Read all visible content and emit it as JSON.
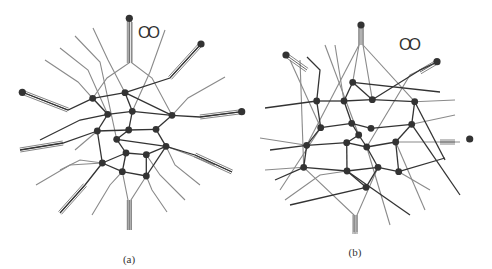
{
  "figure": {
    "panels": [
      {
        "id": "a",
        "caption": "(a)",
        "caption_pos": [
          129,
          253
        ],
        "marker_label": "OO",
        "marker_pos": [
          138,
          24
        ],
        "nodes": [
          [
            92.7,
            98.3
          ],
          [
            125,
            92.7
          ],
          [
            107.7,
            114.3
          ],
          [
            132.3,
            111.3
          ],
          [
            172,
            115.3
          ],
          [
            97.3,
            131
          ],
          [
            128.7,
            130
          ],
          [
            156,
            129.3
          ],
          [
            116.7,
            139.3
          ],
          [
            166,
            146.3
          ],
          [
            126,
            153
          ],
          [
            146.3,
            154.7
          ],
          [
            102.3,
            163
          ],
          [
            122.3,
            171.7
          ],
          [
            146.3,
            176
          ]
        ],
        "terminals": [
          [
            129.3,
            18.3
          ],
          [
            201,
            44
          ],
          [
            22.3,
            92.3
          ],
          [
            241.7,
            111.7
          ]
        ],
        "dark_edges": [
          [
            0,
            1
          ],
          [
            1,
            4
          ],
          [
            2,
            3
          ],
          [
            3,
            4
          ],
          [
            5,
            6
          ],
          [
            6,
            7
          ],
          [
            8,
            9
          ],
          [
            10,
            11
          ],
          [
            11,
            9
          ],
          [
            12,
            13
          ],
          [
            13,
            14
          ],
          [
            0,
            2
          ],
          [
            2,
            5
          ],
          [
            5,
            12
          ],
          [
            1,
            3
          ],
          [
            3,
            6
          ],
          [
            6,
            8
          ],
          [
            8,
            10
          ],
          [
            10,
            13
          ],
          [
            4,
            7
          ],
          [
            7,
            9
          ],
          [
            9,
            14
          ],
          [
            12,
            10
          ],
          [
            14,
            11
          ]
        ],
        "dark_paths": [
          "M22,92 L68,110 L92.7,98.3",
          "M201,44 L170,78 L125,92.7",
          "M241.7,111.7 L200,117 L172,115.3",
          "M20,150 L63,143 L97.3,131",
          "M60,213 L85,185 L102.3,163",
          "M232,172 L195,155 L166,146.3",
          "M40,140 L80,120 L107.7,114.3"
        ],
        "gray_paths": [
          "M129,22 L129,63 L107,78 L92.7,98.3",
          "M132,22 L132,63 L152,78 L172,115.3",
          "M45,60 L78,82 L92.7,98.3",
          "M60,48 L88,70 L107.7,114.3",
          "M75,36 L100,62 L116.7,139.3",
          "M93,28 L108,60 L125,92.7",
          "M165,30 L150,72 L132.3,111.3",
          "M225,77 L188,98 L172,115.3",
          "M36,185 L70,165 L102.3,163",
          "M128,230 L128,200 L122.3,171.7",
          "M131,230 L131,200 L146.3,176",
          "M92,215 L110,185 L122.3,171.7",
          "M167,212 L152,190 L146.3,176",
          "M185,200 L160,175 L146.3,154.7",
          "M200,185 L175,165 L166,146.3",
          "M215,165 L190,155 L166,146.3",
          "M75,150 L97.3,131",
          "M60,170 L80,160 L102.3,163"
        ],
        "triple_leads": [
          {
            "from": [
              129.3,
              18.3
            ],
            "to": [
              129.3,
              63
            ],
            "dir": "v"
          },
          {
            "from": [
              201,
              44
            ],
            "to": [
              170,
              78
            ],
            "dir": "d"
          },
          {
            "from": [
              22.3,
              92.3
            ],
            "to": [
              68,
              110
            ],
            "dir": "d"
          },
          {
            "from": [
              241.7,
              111.7
            ],
            "to": [
              200,
              117
            ],
            "dir": "d"
          },
          {
            "from": [
              20,
              150
            ],
            "to": [
              63,
              143
            ],
            "dir": "d"
          },
          {
            "from": [
              60,
              213
            ],
            "to": [
              85,
              185
            ],
            "dir": "d"
          },
          {
            "from": [
              232,
              172
            ],
            "to": [
              195,
              155
            ],
            "dir": "d"
          },
          {
            "from": [
              129.3,
              230
            ],
            "to": [
              129.3,
              200
            ],
            "dir": "v"
          }
        ]
      },
      {
        "id": "b",
        "caption": "(b)",
        "caption_pos": [
          355,
          246
        ],
        "marker_label": "OO",
        "marker_pos": [
          399,
          36
        ],
        "nodes": [
          [
            352.7,
            82.3
          ],
          [
            316.7,
            101
          ],
          [
            344,
            101
          ],
          [
            372.3,
            99.7
          ],
          [
            414.7,
            101.7
          ],
          [
            320.7,
            127.7
          ],
          [
            351.7,
            123.3
          ],
          [
            371,
            128.3
          ],
          [
            411.7,
            124.3
          ],
          [
            358.7,
            135
          ],
          [
            306.7,
            145.3
          ],
          [
            346.7,
            142.7
          ],
          [
            366.7,
            147
          ],
          [
            395.7,
            142
          ],
          [
            303.7,
            167.3
          ],
          [
            347,
            171
          ],
          [
            378,
            167.3
          ],
          [
            398.7,
            171.7
          ],
          [
            366,
            187.3
          ]
        ],
        "terminals": [
          [
            361,
            25
          ],
          [
            286,
            55
          ],
          [
            437,
            61.7
          ],
          [
            469.7,
            139
          ]
        ],
        "dark_edges": [
          [
            0,
            2
          ],
          [
            1,
            2
          ],
          [
            2,
            3
          ],
          [
            3,
            4
          ],
          [
            1,
            5
          ],
          [
            5,
            6
          ],
          [
            6,
            7
          ],
          [
            7,
            8
          ],
          [
            8,
            4
          ],
          [
            0,
            3
          ],
          [
            2,
            6
          ],
          [
            6,
            9
          ],
          [
            9,
            12
          ],
          [
            5,
            10
          ],
          [
            10,
            14
          ],
          [
            14,
            15
          ],
          [
            15,
            16
          ],
          [
            16,
            17
          ],
          [
            15,
            18
          ],
          [
            11,
            12
          ],
          [
            12,
            13
          ],
          [
            13,
            8
          ],
          [
            11,
            15
          ],
          [
            9,
            11
          ],
          [
            16,
            12
          ],
          [
            17,
            13
          ],
          [
            18,
            16
          ],
          [
            10,
            11
          ]
        ],
        "dark_paths": [
          "M265,108 L316.7,101",
          "M307,57 L320,70 L316.7,101",
          "M437,62 L420,70 L372.3,99.7",
          "M352.7,82.3 L440,92",
          "M414.7,101.7 L445,160",
          "M303.7,167.3 L275,180",
          "M366,187.3 L290,205",
          "M398.7,171.7 L445,158",
          "M306.7,145.3 L270,150",
          "M347,171 L410,215",
          "M411.7,124.3 L460,195"
        ],
        "gray_paths": [
          "M359,28 L359,45 L352.7,82.3",
          "M363,28 L363,45 L372.3,99.7",
          "M290,60 L320.7,127.7",
          "M300,60 L303.7,167.3",
          "M325,45 L358.7,135",
          "M335,45 L344,101",
          "M359,45 L306.7,145.3",
          "M363,45 L414.7,101.7",
          "M437,62 L410,75 L366.7,147",
          "M455,100 L414.7,101.7",
          "M455,115 L411.7,124.3",
          "M460,142 L430,142 L395.7,142",
          "M260,138 L306.7,145.3",
          "M265,170 L303.7,167.3",
          "M285,200 L320,175 L347,171",
          "M354,232 L354,215 L303.7,167.3",
          "M357,232 L357,215 L378,167.3",
          "M390,225 L366.7,147",
          "M425,210 L395.7,142",
          "M430,190 L398.7,171.7",
          "M280,190 L320.7,127.7"
        ],
        "triple_leads": [
          {
            "from": [
              361,
              28
            ],
            "to": [
              361,
              45
            ],
            "dir": "v"
          },
          {
            "from": [
              286,
              55
            ],
            "to": [
              307,
              70
            ],
            "dir": "d"
          },
          {
            "from": [
              437,
              62
            ],
            "to": [
              420,
              72
            ],
            "dir": "d"
          },
          {
            "from": [
              355,
              234
            ],
            "to": [
              355,
              215
            ],
            "dir": "v"
          },
          {
            "from": [
              455,
              142
            ],
            "to": [
              440,
              142
            ],
            "dir": "d"
          }
        ]
      }
    ]
  }
}
